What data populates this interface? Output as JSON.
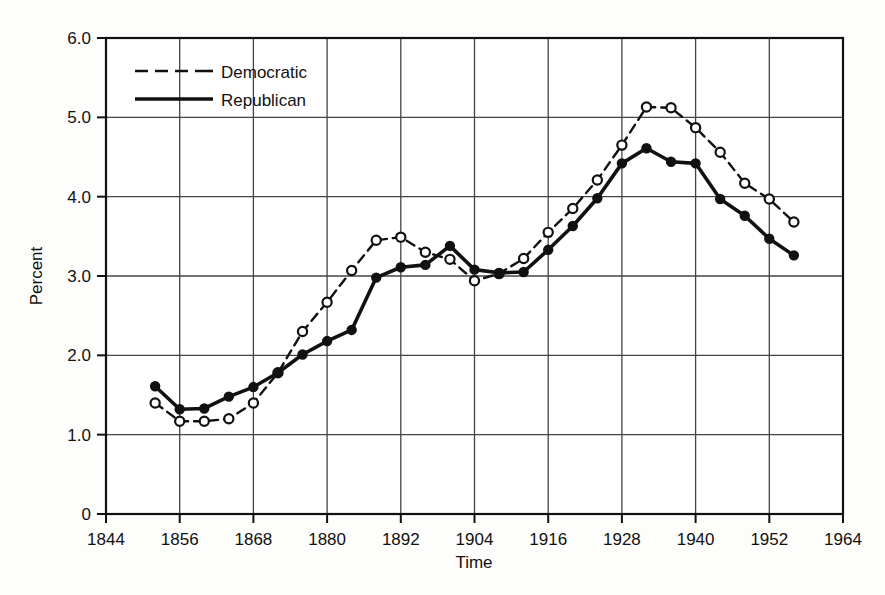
{
  "chart_data": {
    "type": "line",
    "title": "",
    "xlabel": "Time",
    "ylabel": "Percent",
    "xlim": [
      1844,
      1964
    ],
    "ylim": [
      0,
      6.0
    ],
    "grid": true,
    "legend_position": "top-left",
    "xticks": [
      "1844",
      "1856",
      "1868",
      "1880",
      "1892",
      "1904",
      "1916",
      "1928",
      "1940",
      "1952",
      "1964"
    ],
    "xtick_values": [
      1844,
      1856,
      1868,
      1880,
      1892,
      1904,
      1916,
      1928,
      1940,
      1952,
      1964
    ],
    "yticks": [
      "0",
      "1.0",
      "2.0",
      "3.0",
      "4.0",
      "5.0",
      "6.0"
    ],
    "ytick_values": [
      0,
      1.0,
      2.0,
      3.0,
      4.0,
      5.0,
      6.0
    ],
    "x": [
      1852,
      1856,
      1860,
      1864,
      1868,
      1872,
      1876,
      1880,
      1884,
      1888,
      1892,
      1896,
      1900,
      1904,
      1908,
      1912,
      1916,
      1920,
      1924,
      1928,
      1932,
      1936,
      1940,
      1944,
      1948,
      1952,
      1956
    ],
    "series": [
      {
        "name": "Democratic",
        "marker": "open-circle",
        "line_style": "dashed",
        "color": "#111111",
        "values": [
          1.4,
          1.17,
          1.17,
          1.2,
          1.4,
          1.78,
          2.3,
          2.67,
          3.07,
          3.45,
          3.49,
          3.3,
          3.21,
          2.94,
          3.03,
          3.22,
          3.55,
          3.85,
          4.21,
          4.65,
          5.13,
          5.12,
          4.87,
          4.56,
          4.17,
          3.97,
          3.68
        ]
      },
      {
        "name": "Republican",
        "marker": "filled-circle",
        "line_style": "solid",
        "color": "#111111",
        "values": [
          1.61,
          1.32,
          1.33,
          1.48,
          1.6,
          1.78,
          2.01,
          2.18,
          2.32,
          2.98,
          3.11,
          3.14,
          3.38,
          3.08,
          3.04,
          3.05,
          3.33,
          3.63,
          3.98,
          4.42,
          4.61,
          4.44,
          4.42,
          3.97,
          3.76,
          3.47,
          3.26
        ]
      }
    ]
  },
  "legend": {
    "items": [
      {
        "label": "Democratic",
        "style": "dashed"
      },
      {
        "label": "Republican",
        "style": "solid"
      }
    ]
  },
  "axes": {
    "x_title": "Time",
    "y_title": "Percent"
  }
}
